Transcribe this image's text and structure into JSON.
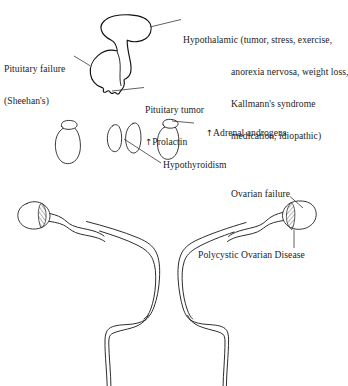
{
  "figure": {
    "background_color": "#ffffff",
    "ink_color": "#111111"
  },
  "labels": {
    "hypothalamic": {
      "lead": "Hypothalamic",
      "line1": "(tumor, stress, exercise,",
      "line2": "anorexia nervosa, weight loss,",
      "line3": "Kallmann's syndrome",
      "line4": "medication, idiopathic)"
    },
    "pituitary_failure": {
      "line1": "Pituitary failure",
      "line2": "(Sheehan's)"
    },
    "pituitary_tumor": {
      "line1": "Pituitary tumor",
      "arrow": "↑",
      "line2": "Prolactin"
    },
    "adrenal_androgens": {
      "arrow": "↑",
      "text": "Adrenal androgens"
    },
    "hypothyroidism": {
      "text": "Hypothyroidism"
    },
    "ovarian_failure": {
      "text": "Ovarian failure"
    },
    "polycystic_ovarian_disease": {
      "text": "Polycystic Ovarian Disease"
    }
  },
  "organs": {
    "hypothalamus": "hypothalamus-shape",
    "pituitary": "pituitary-gland-shape",
    "pituitary_stalk": "infundibulum-stalk",
    "adrenal_left": "adrenal-gland-and-kidney-left",
    "adrenal_right": "adrenal-gland-and-kidney-right",
    "thyroid_lobe_left": "thyroid-lobe-left",
    "thyroid_lobe_right": "thyroid-lobe-right",
    "uterus": "uterus-body",
    "cervix": "cervix-and-vagina",
    "fallopian_tube_left": "fallopian-tube-left",
    "fallopian_tube_right": "fallopian-tube-right",
    "ovary_left": "ovary-left",
    "ovary_right": "ovary-right"
  }
}
